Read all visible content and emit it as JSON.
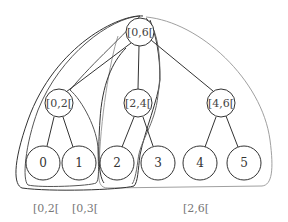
{
  "diagram": {
    "nodes": {
      "root": {
        "label": "[0,6["
      },
      "left": {
        "label": "[0,2["
      },
      "middle": {
        "label": "[2,4["
      },
      "right": {
        "label": "[4,6["
      },
      "leaves": [
        "0",
        "1",
        "2",
        "3",
        "4",
        "5"
      ]
    },
    "query_labels": [
      {
        "label": "[0,2[",
        "color": "#555555"
      },
      {
        "label": "[0,3[",
        "color": "#333333"
      },
      {
        "label": "[2,6[",
        "color": "#999999"
      }
    ],
    "colors": {
      "stroke": "#333333",
      "region_dark": "#333333",
      "region_mid": "#555555",
      "region_light": "#999999"
    }
  }
}
